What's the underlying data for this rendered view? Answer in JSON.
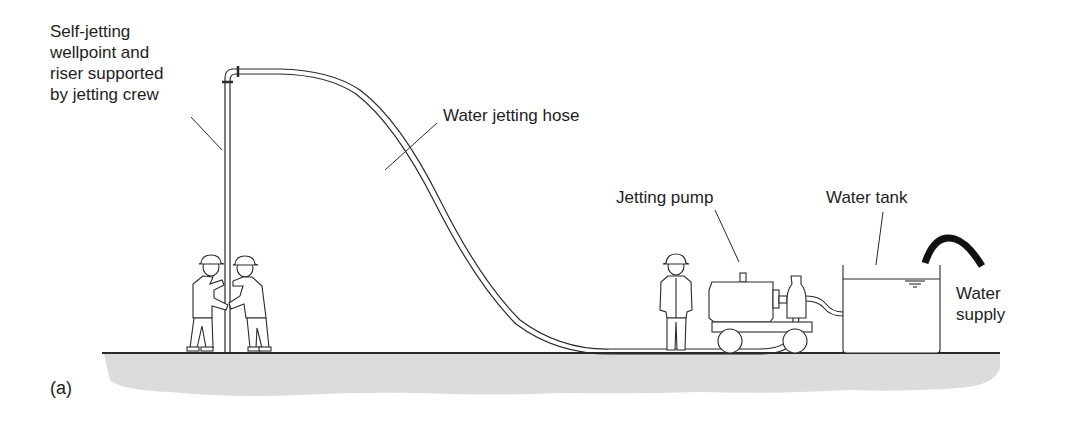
{
  "figure": {
    "panel_label": "(a)",
    "labels": {
      "wellpoint": [
        "Self-jetting",
        "wellpoint and",
        "riser supported",
        "by jetting crew"
      ],
      "hose": "Water jetting hose",
      "pump": "Jetting pump",
      "tank": "Water tank",
      "supply": [
        "Water",
        "supply"
      ]
    },
    "colors": {
      "line": "#2a2a2a",
      "ground_fill": "#dcdcdc",
      "background": "#ffffff",
      "supply_hose": "#111111"
    },
    "components": [
      "wellpoint-riser",
      "jetting-crew-worker-1",
      "jetting-crew-worker-2",
      "water-jetting-hose",
      "pump-operator",
      "jetting-pump-on-trolley",
      "water-tank",
      "water-supply-hose",
      "ground"
    ]
  }
}
